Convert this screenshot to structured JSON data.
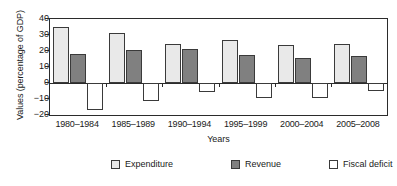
{
  "chart_data": {
    "type": "bar",
    "title": "",
    "xlabel": "Years",
    "ylabel": "Values (percentage of GDP)",
    "categories": [
      "1980–1984",
      "1985–1989",
      "1990–1994",
      "1995–1999",
      "2000–2004",
      "2005–2008"
    ],
    "series": [
      {
        "name": "Expenditure",
        "color": "#e9e9e9",
        "values": [
          35.2,
          31.2,
          24.5,
          27.0,
          23.8,
          24.5
        ]
      },
      {
        "name": "Revenue",
        "color": "#808080",
        "values": [
          18.2,
          20.4,
          21.0,
          17.7,
          15.4,
          16.8
        ]
      },
      {
        "name": "Fiscal deficit",
        "color": "#ffffff",
        "values": [
          -17.0,
          -11.2,
          -5.4,
          -9.3,
          -9.4,
          -4.8
        ]
      }
    ],
    "ylim": [
      -20,
      40
    ],
    "yticks": [
      40,
      30,
      20,
      10,
      0,
      -10,
      -20
    ],
    "ytick_labels": [
      "40",
      "30",
      "20",
      "10",
      "0",
      "−10",
      "−20"
    ],
    "grid": false,
    "legend_position": "bottom",
    "legend_entries": [
      "Expenditure",
      "Revenue",
      "Fiscal deficit"
    ]
  }
}
